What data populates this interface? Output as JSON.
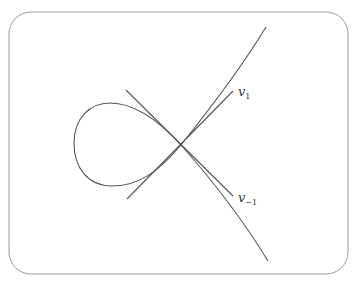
{
  "diagram": {
    "colors": {
      "background": "#ffffff",
      "frame": "#9a9a9a",
      "curve": "#555555",
      "tangents": "#555555",
      "label": "#333333"
    },
    "frame": {
      "x": 9,
      "y": 12,
      "width": 339,
      "height": 262,
      "radius": 22
    },
    "node": {
      "x": 181,
      "y": 145
    },
    "curve_endpoints": {
      "upper_right": {
        "x": 266,
        "y": 27
      },
      "lower_right": {
        "x": 268,
        "y": 261
      }
    },
    "tangent_lines": [
      {
        "name": "v1",
        "from": {
          "x": 127,
          "y": 199
        },
        "to": {
          "x": 233,
          "y": 91
        },
        "label": {
          "main": "v",
          "subscript": "1",
          "x": 238,
          "y": 96
        }
      },
      {
        "name": "v-1",
        "from": {
          "x": 126,
          "y": 90
        },
        "to": {
          "x": 233,
          "y": 196
        },
        "label": {
          "main": "v",
          "subscript": "−1",
          "x": 238,
          "y": 202
        }
      }
    ],
    "labels": {
      "v1_main": "v",
      "v1_sub": "1",
      "vm1_main": "v",
      "vm1_sub": "−1"
    }
  }
}
